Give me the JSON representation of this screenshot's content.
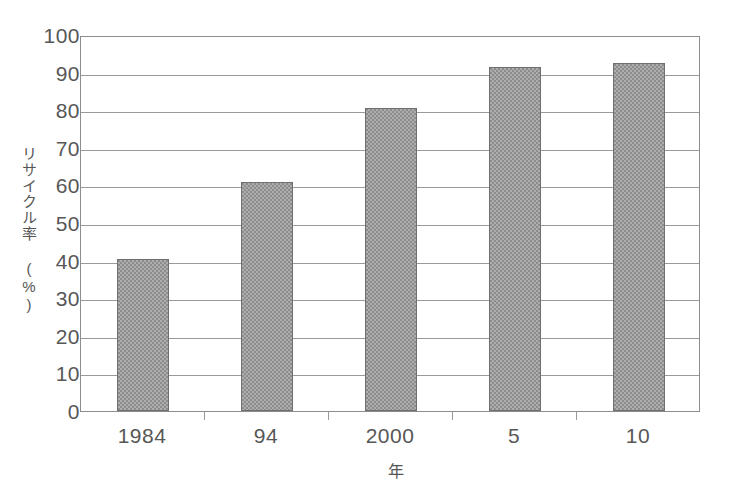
{
  "chart_data": {
    "type": "bar",
    "title": "",
    "subtitle": "",
    "categories": [
      "1984",
      "94",
      "2000",
      "5",
      "10"
    ],
    "values": [
      40.5,
      61,
      80.5,
      91.5,
      92.5
    ],
    "series": [
      {
        "name": "リサイクル率",
        "values": [
          40.5,
          61,
          80.5,
          91.5,
          92.5
        ]
      }
    ],
    "xlabel": "年",
    "ylabel": "リサイクル率 (%)",
    "ylim": [
      0,
      100
    ],
    "ytick_labels": [
      "100",
      "90",
      "80",
      "70",
      "60",
      "50",
      "40",
      "30",
      "20",
      "10",
      "0"
    ],
    "ytick_values": [
      100,
      90,
      80,
      70,
      60,
      50,
      40,
      30,
      20,
      10,
      0
    ],
    "grid": true,
    "grid_axis": "y",
    "legend": false,
    "legend_position": "none",
    "bar_color": "#8d8d8d",
    "bar_edge_color": "#6f6f6f",
    "axis_color": "#8d8d8d",
    "grid_color": "#9a9a9a",
    "text_color": "#575757",
    "background_color": "#ffffff"
  },
  "axes": {
    "y_title": "リサイクル率 (%)",
    "x_title": "年"
  }
}
